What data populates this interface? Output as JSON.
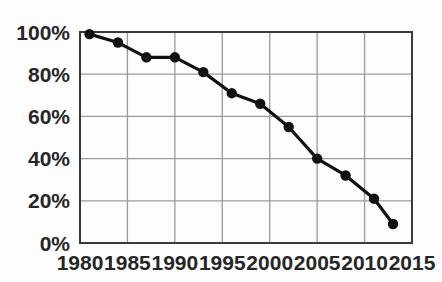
{
  "chart_data": {
    "type": "line",
    "title": "",
    "subtitle": "",
    "xlabel": "",
    "ylabel": "",
    "xlim": [
      1980,
      2015
    ],
    "ylim": [
      0,
      100
    ],
    "grid": true,
    "legend": null,
    "x_ticks": [
      "1980",
      "1985",
      "1990",
      "1995",
      "2000",
      "2005",
      "2010",
      "2015"
    ],
    "x_tick_values": [
      1980,
      1985,
      1990,
      1995,
      2000,
      2005,
      2010,
      2015
    ],
    "y_ticks": [
      "0%",
      "20%",
      "40%",
      "60%",
      "80%",
      "100%"
    ],
    "y_tick_values": [
      0,
      20,
      40,
      60,
      80,
      100
    ],
    "series": [
      {
        "name": "",
        "marker": "filled-circle",
        "color": "#111111",
        "x": [
          1981,
          1984,
          1987,
          1990,
          1993,
          1996,
          1999,
          2002,
          2005,
          2008,
          2011,
          2013
        ],
        "values": [
          99,
          95,
          88,
          88,
          81,
          71,
          66,
          55,
          40,
          32,
          21,
          9
        ]
      }
    ]
  },
  "colors": {
    "line": "#111111",
    "marker": "#111111",
    "grid": "#9a9a9a",
    "axis": "#3a3a3a",
    "text": "#262626",
    "background": "#fdfdfd"
  }
}
